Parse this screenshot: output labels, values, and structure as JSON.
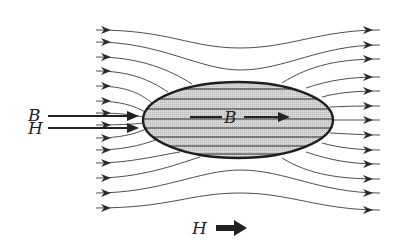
{
  "diagram": {
    "labels": {
      "outside_B": "B",
      "outside_H": "H",
      "inside_B": "B",
      "bottom_H": "H"
    },
    "field_line_count_outside": 13,
    "field_line_count_inside": 8,
    "colors": {
      "line": "#3a3a3a",
      "ellipse_fill": "#cfcfcf",
      "ellipse_stroke": "#1e1e1e",
      "text": "#222222"
    }
  }
}
